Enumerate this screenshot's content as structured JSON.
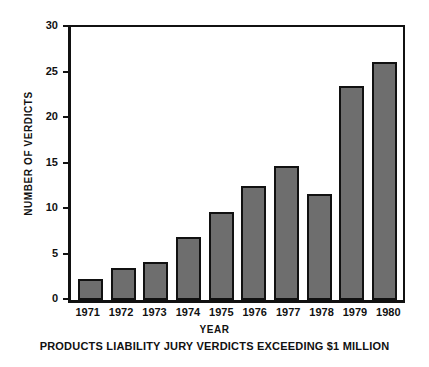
{
  "chart_data": {
    "type": "bar",
    "title": "",
    "caption": "PRODUCTS LIABILITY JURY VERDICTS EXCEEDING $1 MILLION",
    "xlabel": "YEAR",
    "ylabel": "NUMBER OF VERDICTS",
    "categories": [
      "1971",
      "1972",
      "1973",
      "1974",
      "1975",
      "1976",
      "1977",
      "1978",
      "1979",
      "1980"
    ],
    "values": [
      2.3,
      3.5,
      4.2,
      6.9,
      9.7,
      12.5,
      14.7,
      11.7,
      23.5,
      26.2
    ],
    "ylim": [
      0,
      30
    ],
    "yticks": [
      0,
      5,
      10,
      15,
      20,
      25,
      30
    ],
    "ytick_labels": [
      "0",
      "5",
      "10",
      "15",
      "20",
      "25",
      "30"
    ],
    "grid": false,
    "legend": false,
    "bar_color": "#6e6e6e",
    "bar_edge_color": "#111111",
    "axis_color": "#111111",
    "background": "#ffffff"
  }
}
